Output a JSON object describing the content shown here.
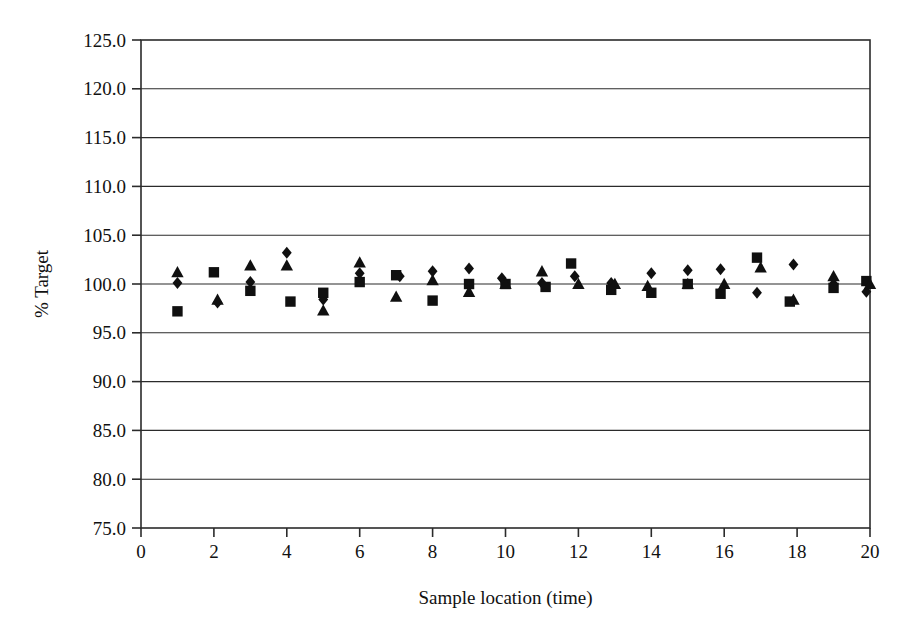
{
  "chart_data": {
    "type": "scatter",
    "title": "",
    "xlabel": "Sample location (time)",
    "ylabel": "% Target",
    "xlim": [
      0,
      20
    ],
    "ylim": [
      75.0,
      125.0
    ],
    "xticks": [
      0,
      2,
      4,
      6,
      8,
      10,
      12,
      14,
      16,
      18,
      20
    ],
    "xtick_labels": [
      "0",
      "2",
      "4",
      "6",
      "8",
      "10",
      "12",
      "14",
      "16",
      "18",
      "20"
    ],
    "yticks": [
      75.0,
      80.0,
      85.0,
      90.0,
      95.0,
      100.0,
      105.0,
      110.0,
      115.0,
      120.0,
      125.0
    ],
    "ytick_labels": [
      "75.0",
      "80.0",
      "85.0",
      "90.0",
      "95.0",
      "100.0",
      "105.0",
      "110.0",
      "115.0",
      "120.0",
      "125.0"
    ],
    "grid": true,
    "grid_axis": "y",
    "legend": null,
    "legend_position": "none",
    "marker_color": "#101010",
    "series": [
      {
        "name": "Series 1",
        "marker": "diamond",
        "color": "#101010",
        "x": [
          1.0,
          2.1,
          3.0,
          4.0,
          5.0,
          6.0,
          7.1,
          8.0,
          9.0,
          9.9,
          11.0,
          11.9,
          12.9,
          14.0,
          15.0,
          15.9,
          16.9,
          17.9,
          19.0,
          19.9
        ],
        "y": [
          100.1,
          98.1,
          100.2,
          103.2,
          98.4,
          101.1,
          100.8,
          101.3,
          101.6,
          100.6,
          100.1,
          100.8,
          100.1,
          101.1,
          101.4,
          101.5,
          99.1,
          102.0,
          100.0,
          99.2
        ]
      },
      {
        "name": "Series 2",
        "marker": "square",
        "color": "#101010",
        "x": [
          1.0,
          2.0,
          3.0,
          4.1,
          5.0,
          6.0,
          7.0,
          8.0,
          9.0,
          10.0,
          11.1,
          11.8,
          12.9,
          14.0,
          15.0,
          15.9,
          16.9,
          17.8,
          19.0,
          19.9
        ],
        "y": [
          97.2,
          101.2,
          99.3,
          98.2,
          99.1,
          100.2,
          100.9,
          98.3,
          100.0,
          100.0,
          99.7,
          102.1,
          99.4,
          99.1,
          100.0,
          99.0,
          102.7,
          98.2,
          99.6,
          100.3
        ]
      },
      {
        "name": "Series 3",
        "marker": "triangle",
        "color": "#101010",
        "x": [
          1.0,
          2.1,
          3.0,
          4.0,
          5.0,
          6.0,
          7.0,
          8.0,
          9.0,
          10.0,
          11.0,
          12.0,
          13.0,
          13.9,
          15.0,
          16.0,
          17.0,
          17.9,
          19.0,
          20.0
        ],
        "y": [
          101.2,
          98.4,
          101.9,
          101.9,
          97.3,
          102.2,
          98.7,
          100.4,
          99.2,
          100.0,
          101.3,
          100.0,
          100.0,
          99.8,
          100.0,
          100.0,
          101.7,
          98.4,
          100.8,
          100.0
        ]
      }
    ]
  }
}
